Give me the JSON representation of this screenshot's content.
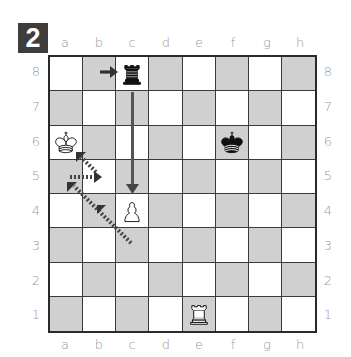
{
  "diagram": {
    "number": "2",
    "files": [
      "a",
      "b",
      "c",
      "d",
      "e",
      "f",
      "g",
      "h"
    ],
    "ranks": [
      "8",
      "7",
      "6",
      "5",
      "4",
      "3",
      "2",
      "1"
    ],
    "colors": {
      "badge_bg": "#3d3d3d",
      "dark_square": "#d9d9d9",
      "light_square": "#ffffff",
      "border": "#2a2a2a",
      "arrow": "#3a3a3a",
      "label": "#9a9a9a"
    },
    "pieces": [
      {
        "square": "c8",
        "type": "rook",
        "color": "black",
        "icon": "black-rook-icon"
      },
      {
        "square": "a6",
        "type": "king",
        "color": "white",
        "icon": "white-king-icon"
      },
      {
        "square": "f6",
        "type": "king",
        "color": "black",
        "icon": "black-king-icon"
      },
      {
        "square": "c4",
        "type": "pawn",
        "color": "white",
        "icon": "white-pawn-icon"
      },
      {
        "square": "e1",
        "type": "rook",
        "color": "white",
        "icon": "white-rook-icon"
      }
    ],
    "arrows": [
      {
        "style": "solid",
        "from": "b8",
        "to": "c8",
        "description": "rook arrives on c8"
      },
      {
        "style": "solid",
        "from": "c7",
        "to": "c4",
        "description": "rook moves down the c-file"
      },
      {
        "style": "dotted",
        "from": "c3",
        "to": "a5",
        "description": "diagonal path with arrowheads toward a5"
      },
      {
        "style": "dotted",
        "from": "b5",
        "to": "a6",
        "description": "short arrow back toward king on a6"
      },
      {
        "style": "dotted",
        "from": "a5",
        "to": "b5",
        "description": "horizontal arrow a5 to b5"
      }
    ]
  }
}
